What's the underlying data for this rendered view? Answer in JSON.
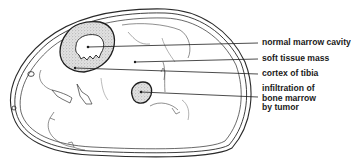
{
  "figure": {
    "type": "anatomical cross-section",
    "colors": {
      "line": "#2a2a2a",
      "stipple_fill": "#d4d4d4",
      "background": "#ffffff"
    }
  },
  "labels": [
    {
      "id": "normal-marrow-cavity",
      "lines": [
        "normal marrow cavity"
      ]
    },
    {
      "id": "soft-tissue-mass",
      "lines": [
        "soft tissue mass"
      ]
    },
    {
      "id": "cortex-of-tibia",
      "lines": [
        "cortex of tibia"
      ]
    },
    {
      "id": "infiltration-of-bone-marrow",
      "lines": [
        "infiltration of",
        "bone marrow",
        "by tumor"
      ]
    }
  ]
}
